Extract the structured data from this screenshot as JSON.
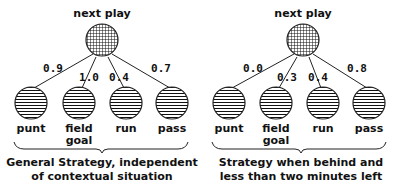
{
  "diagrams": [
    {
      "root_label": "next play",
      "children": [
        {
          "label": "punt",
          "label2": "",
          "weight": "0.9"
        },
        {
          "label": "field",
          "label2": "goal",
          "weight": "1.0"
        },
        {
          "label": "run",
          "label2": "",
          "weight": "0.4"
        },
        {
          "label": "pass",
          "label2": "",
          "weight": "0.7"
        }
      ],
      "caption_line1": "General Strategy, independent",
      "caption_line2": "of contextual situation"
    },
    {
      "root_label": "next play",
      "children": [
        {
          "label": "punt",
          "label2": "",
          "weight": "0.0"
        },
        {
          "label": "field",
          "label2": "goal",
          "weight": "0.3"
        },
        {
          "label": "run",
          "label2": "",
          "weight": "0.4"
        },
        {
          "label": "pass",
          "label2": "",
          "weight": "0.8"
        }
      ],
      "caption_line1": "Strategy when behind and",
      "caption_line2": "less than two minutes left"
    }
  ],
  "colors": {
    "ink": "#111111",
    "background": "#ffffff"
  }
}
